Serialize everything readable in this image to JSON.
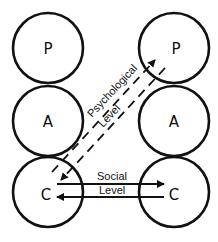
{
  "diagram": {
    "type": "transactional-analysis-ego-states",
    "left_person": {
      "states": [
        {
          "label": "P",
          "cx": 48,
          "cy": 48
        },
        {
          "label": "A",
          "cx": 48,
          "cy": 121
        },
        {
          "label": "C",
          "cx": 48,
          "cy": 192
        }
      ]
    },
    "right_person": {
      "states": [
        {
          "label": "P",
          "cx": 174,
          "cy": 48
        },
        {
          "label": "A",
          "cx": 174,
          "cy": 121
        },
        {
          "label": "C",
          "cx": 174,
          "cy": 192
        }
      ]
    },
    "radius": 35,
    "transactions": {
      "psychological": {
        "line1": "Psychological",
        "line2": "Level",
        "style": "dashed"
      },
      "social": {
        "line1": "Social",
        "line2": "Level",
        "style": "solid"
      }
    }
  }
}
